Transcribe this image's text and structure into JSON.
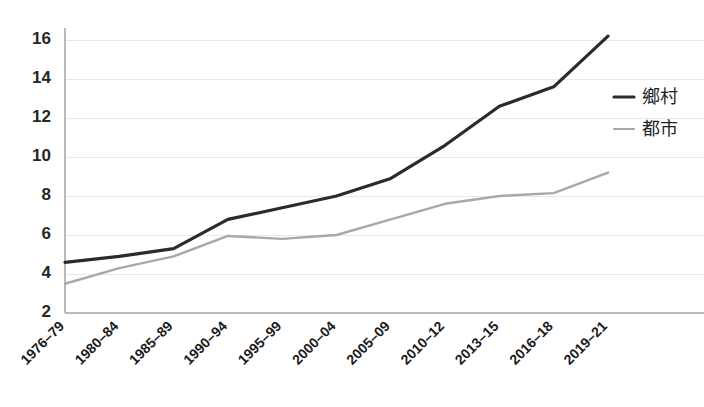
{
  "chart_data": {
    "type": "line",
    "title": "",
    "subtitle": "",
    "xlabel": "",
    "ylabel": "",
    "categories": [
      "1976–79",
      "1980–84",
      "1985–89",
      "1990–94",
      "1995–99",
      "2000–04",
      "2005–09",
      "2010–12",
      "2013–15",
      "2016–18",
      "2019–21"
    ],
    "yticks": [
      2,
      4,
      6,
      8,
      10,
      12,
      14,
      16
    ],
    "ylim": [
      2,
      16
    ],
    "grid": "horizontal",
    "legend_position": "right",
    "series": [
      {
        "name": "鄉村",
        "color": "#2b2b2b",
        "values": [
          4.6,
          4.9,
          5.3,
          6.8,
          7.4,
          8.0,
          8.9,
          10.6,
          12.6,
          13.6,
          16.2
        ]
      },
      {
        "name": "都市",
        "color": "#a8a8a8",
        "values": [
          3.5,
          4.3,
          4.9,
          5.95,
          5.8,
          6.0,
          6.8,
          7.6,
          8.0,
          8.15,
          9.2
        ]
      }
    ]
  },
  "legend": {
    "items": [
      {
        "label": "鄉村",
        "marker": "line-marker-dark"
      },
      {
        "label": "都市",
        "marker": "line-marker-gray"
      }
    ]
  },
  "colors": {
    "series_rural": "#2b2b2b",
    "series_urban": "#a8a8a8",
    "gridline": "#e8e8e8",
    "axis": "#b9b9b9",
    "background": "#ffffff",
    "tick_text": "#262626"
  }
}
